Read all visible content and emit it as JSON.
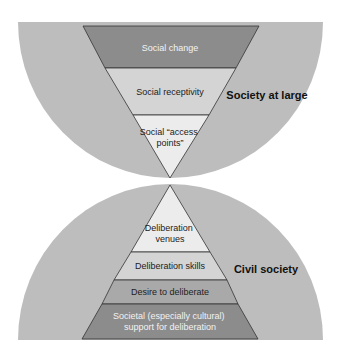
{
  "colors": {
    "background": "#ffffff",
    "semicircle": "#bdbdbd",
    "stroke": "#333333",
    "dark_band": "#8c8c8c",
    "mid_band": "#d4d4d4",
    "light_band": "#ececec",
    "darker_band": "#a9a9a9"
  },
  "top_section": {
    "label": "Society at large",
    "bands": [
      {
        "label": "Social change",
        "lines": [
          "Social change"
        ],
        "shade": "dark"
      },
      {
        "label": "Social receptivity",
        "lines": [
          "Social receptivity"
        ],
        "shade": "mid"
      },
      {
        "label": "Social “access points”",
        "lines": [
          "Social “access",
          "points”"
        ],
        "shade": "light"
      }
    ]
  },
  "bottom_section": {
    "label": "Civil society",
    "bands": [
      {
        "label": "Deliberation venues",
        "lines": [
          "Deliberation",
          "venues"
        ],
        "shade": "light"
      },
      {
        "label": "Deliberation skills",
        "lines": [
          "Deliberation skills"
        ],
        "shade": "mid"
      },
      {
        "label": "Desire to deliberate",
        "lines": [
          "Desire to deliberate"
        ],
        "shade": "darker"
      },
      {
        "label": "Societal (especially cultural) support for deliberation",
        "lines": [
          "Societal (especially cultural)",
          "support for deliberation"
        ],
        "shade": "dark"
      }
    ]
  }
}
